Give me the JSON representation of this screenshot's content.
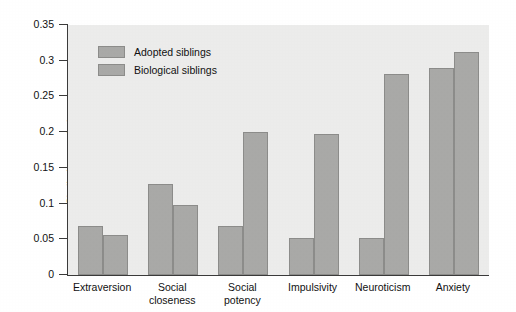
{
  "chart_data": {
    "type": "bar",
    "title": "",
    "xlabel": "",
    "ylabel": "Similarity correlation",
    "ylim": [
      0,
      0.35
    ],
    "ytick_labels": [
      "0",
      "0.05",
      "0.1",
      "0.15",
      "0.2",
      "0.25",
      "0.3",
      "0.35"
    ],
    "ytick_values": [
      0,
      0.05,
      0.1,
      0.15,
      0.2,
      0.25,
      0.3,
      0.35
    ],
    "grid": false,
    "legend_position": "upper-left-inside",
    "categories": [
      "Extraversion",
      "Social\ncloseness",
      "Social\npotency",
      "Impulsivity",
      "Neuroticism",
      "Anxiety"
    ],
    "series": [
      {
        "name": "Adopted siblings",
        "color": "#a9a9a7",
        "values": [
          0.068,
          0.127,
          0.068,
          0.052,
          0.052,
          0.29
        ]
      },
      {
        "name": "Biological siblings",
        "color": "#a9a9a7",
        "values": [
          0.056,
          0.098,
          0.2,
          0.198,
          0.282,
          0.312
        ]
      }
    ]
  },
  "legend": {
    "items": [
      {
        "label": "Adopted siblings"
      },
      {
        "label": "Biological siblings"
      }
    ]
  },
  "colors": {
    "plot_background": "#ececeb",
    "bar_fill": "#a9a9a7",
    "bar_stroke": "#8c8c8a",
    "axis": "#3a3a3a",
    "text": "#111111",
    "page_background": "#ffffff"
  }
}
